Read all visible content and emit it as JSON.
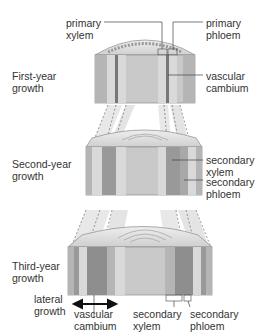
{
  "stage_labels": {
    "first": [
      "First-year",
      "growth"
    ],
    "second": [
      "Second-year",
      "growth"
    ],
    "third": [
      "Third-year",
      "growth"
    ],
    "lateral": [
      "lateral",
      "growth"
    ]
  },
  "callouts": {
    "primary_xylem": [
      "primary",
      "xylem"
    ],
    "primary_phloem": [
      "primary",
      "phloem"
    ],
    "vascular_cambium_top": [
      "vascular",
      "cambium"
    ],
    "secondary_xylem_mid": [
      "secondary",
      "xylem"
    ],
    "secondary_phloem_mid": [
      "secondary",
      "phloem"
    ],
    "vascular_cambium_bottom": [
      "vascular",
      "cambium"
    ],
    "secondary_xylem_bottom": [
      "secondary",
      "xylem"
    ],
    "secondary_phloem_bottom": [
      "secondary",
      "phloem"
    ]
  },
  "colors": {
    "pith": "#c9c9c9",
    "cortex": "#b5b5b5",
    "xylem_light": "#d9d9d9",
    "xylem_dark": "#8e8e8e",
    "phloem": "#a8a8a8",
    "top_face": "#dcdcdc",
    "outline": "#8a8a8a",
    "leader": "#444444",
    "arrow": "#111111"
  }
}
